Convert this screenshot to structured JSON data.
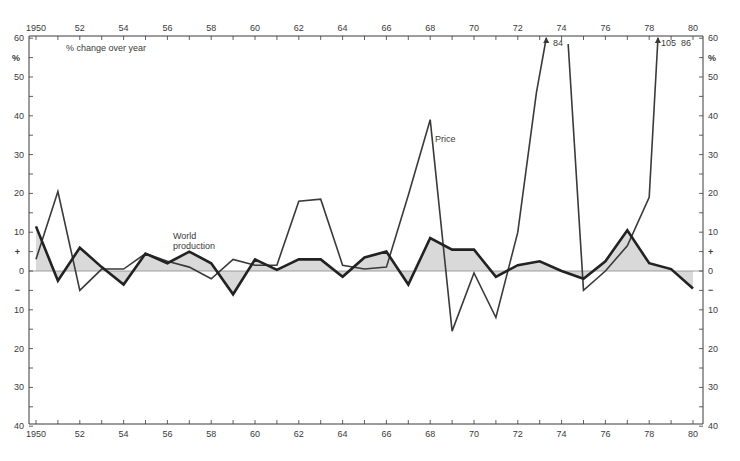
{
  "chart_data": {
    "type": "line",
    "title": "",
    "subtitle": "% change over year",
    "xlabel": "",
    "ylabel": "%",
    "ylim": [
      -40,
      60
    ],
    "xlim": [
      1950,
      1980
    ],
    "grid": false,
    "legend": "inline labels",
    "x": [
      1950,
      1951,
      1952,
      1953,
      1954,
      1955,
      1956,
      1957,
      1958,
      1959,
      1960,
      1961,
      1962,
      1963,
      1964,
      1965,
      1966,
      1967,
      1968,
      1969,
      1970,
      1971,
      1972,
      1973,
      1974,
      1975,
      1976,
      1977,
      1978,
      1979,
      1980
    ],
    "series": [
      {
        "name": "World production",
        "style": "thick line with shaded area to zero",
        "values": [
          11.5,
          -2.5,
          6,
          1,
          -3.5,
          4.5,
          2,
          5,
          2,
          -6,
          3,
          0.3,
          3,
          3,
          -1.5,
          3.5,
          5,
          -3.5,
          8.5,
          5.5,
          5.5,
          -1.5,
          1.5,
          2.5,
          0,
          -2,
          2.5,
          10.5,
          2,
          0.5,
          -4.5
        ]
      },
      {
        "name": "Price",
        "style": "thin line",
        "values": [
          3,
          20.5,
          -5,
          0.5,
          0.5,
          4.5,
          2.5,
          1,
          -2,
          3,
          1.5,
          1.5,
          18,
          18.5,
          1.5,
          0.5,
          1,
          19.5,
          39,
          -15.5,
          -0.5,
          -12,
          10,
          84,
          84,
          -5,
          0,
          6.5,
          19,
          105,
          86
        ],
        "off_scale_annotations": [
          {
            "x": 1973,
            "label": "84"
          },
          {
            "x": 1979,
            "label": "105"
          },
          {
            "x": 1979.5,
            "label": "86"
          }
        ]
      }
    ],
    "x_tick_labels_top": [
      "1950",
      "52",
      "54",
      "56",
      "58",
      "60",
      "62",
      "64",
      "66",
      "68",
      "70",
      "72",
      "74",
      "76",
      "78",
      "80"
    ],
    "x_tick_labels_bottom": [
      "1950",
      "52",
      "54",
      "56",
      "58",
      "60",
      "62",
      "64",
      "66",
      "68",
      "70",
      "72",
      "74",
      "76",
      "78",
      "80"
    ],
    "y_tick_labels": [
      "60",
      "%",
      "50",
      "40",
      "30",
      "20",
      "10",
      "+",
      "0",
      "−",
      "10",
      "20",
      "30",
      "40"
    ],
    "annotations": [
      {
        "text": "% change over year"
      },
      {
        "text": "World production"
      },
      {
        "text": "Price"
      }
    ]
  },
  "labels": {
    "subtitle": "% change over year",
    "percent": "%",
    "world_production_1": "World",
    "world_production_2": "production",
    "price": "Price",
    "arrow_label_84": "84",
    "arrow_label_105": "105",
    "arrow_label_86": "86"
  },
  "colors": {
    "line": "#222222",
    "price_line": "#3a3a3a",
    "fill": "#d9d9d9",
    "axis": "#3a3a3a"
  }
}
